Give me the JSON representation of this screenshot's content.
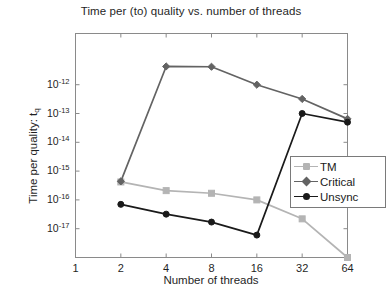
{
  "chart_data": {
    "type": "line",
    "title": "Time per (to) quality vs. number of threads",
    "xlabel": "Number of threads",
    "ylabel": "Time per quality: t",
    "ylabel_sub": "q",
    "xscale": "log2",
    "yscale": "log10",
    "x": [
      2,
      4,
      8,
      16,
      32,
      64
    ],
    "xticks": [
      1,
      2,
      4,
      8,
      16,
      32,
      64
    ],
    "xtick_labels": [
      "1",
      "2",
      "4",
      "8",
      "16",
      "32",
      "64"
    ],
    "xlim": [
      1,
      64
    ],
    "yticks": [
      1e-12,
      1e-13,
      1e-14,
      1e-15,
      1e-16,
      1e-17
    ],
    "ytick_labels": [
      "10",
      "10",
      "10",
      "10",
      "10",
      "10"
    ],
    "ytick_exponents": [
      "-12",
      "-13",
      "-14",
      "-15",
      "-16",
      "-17"
    ],
    "ylim": [
      1e-18,
      6e-11
    ],
    "grid": false,
    "legend_position": "center-right",
    "series": [
      {
        "name": "TM",
        "color": "#b4b4b4",
        "marker": "square",
        "x": [
          2,
          4,
          8,
          16,
          32,
          64
        ],
        "values": [
          4.2e-16,
          2.1e-16,
          1.7e-16,
          1e-16,
          2.2e-17,
          1e-18
        ]
      },
      {
        "name": "Critical",
        "color": "#636363",
        "marker": "diamond",
        "x": [
          2,
          4,
          8,
          16,
          32,
          64
        ],
        "values": [
          4.4e-16,
          4.3e-12,
          4.2e-12,
          1e-12,
          3.2e-13,
          6.5e-14
        ]
      },
      {
        "name": "Unsync",
        "color": "#1a1a1a",
        "marker": "circle",
        "x": [
          2,
          4,
          8,
          16,
          32,
          64
        ],
        "values": [
          7e-17,
          3.2e-17,
          1.7e-17,
          6e-18,
          1e-13,
          5e-14
        ]
      }
    ]
  },
  "legend": {
    "items": [
      {
        "label": "TM"
      },
      {
        "label": "Critical"
      },
      {
        "label": "Unsync"
      }
    ]
  },
  "colors": {
    "tm": "#b4b4b4",
    "critical": "#636363",
    "unsync": "#1a1a1a",
    "axis": "#8a8a8a",
    "text": "#1f1f1f",
    "background": "#ffffff"
  }
}
